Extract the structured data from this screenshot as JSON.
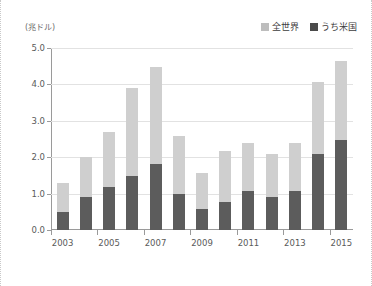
{
  "chart_data": {
    "type": "bar",
    "title": "",
    "subtitle": "",
    "xlabel": "",
    "ylabel": "",
    "unit_label": "(兆ドル)",
    "stacked": true,
    "grid": true,
    "legend_position": "top-right",
    "ylim": [
      0.0,
      5.0
    ],
    "ytick_labels": [
      "0.0",
      "1.0",
      "2.0",
      "3.0",
      "4.0",
      "5.0"
    ],
    "ytick_values": [
      0.0,
      1.0,
      2.0,
      3.0,
      4.0,
      5.0
    ],
    "categories": [
      "2003",
      "2004",
      "2005",
      "2006",
      "2007",
      "2008",
      "2009",
      "2010",
      "2011",
      "2012",
      "2013",
      "2014",
      "2015"
    ],
    "xtick_labels": [
      "2003",
      "2005",
      "2007",
      "2009",
      "2011",
      "2013",
      "2015"
    ],
    "series": [
      {
        "name": "全世界",
        "color": "#cfcfcf",
        "values": [
          1.3,
          2.0,
          2.68,
          3.89,
          4.48,
          2.58,
          1.57,
          2.18,
          2.38,
          2.08,
          2.38,
          4.07,
          4.65
        ]
      },
      {
        "name": "うち米国",
        "color": "#5c5c5c",
        "values": [
          0.49,
          0.9,
          1.19,
          1.48,
          1.8,
          1.0,
          0.59,
          0.78,
          1.08,
          0.9,
          1.08,
          2.08,
          2.48
        ]
      }
    ],
    "colors": {
      "world": "#cfcfcf",
      "us": "#5c5c5c",
      "grid": "#e2e2e2",
      "axis": "#9a9a9a",
      "text": "#5a5a5a"
    }
  },
  "legend": {
    "items": [
      {
        "label": "全世界",
        "swatch": "world-swatch"
      },
      {
        "label": "うち米国",
        "swatch": "us-swatch"
      }
    ]
  }
}
